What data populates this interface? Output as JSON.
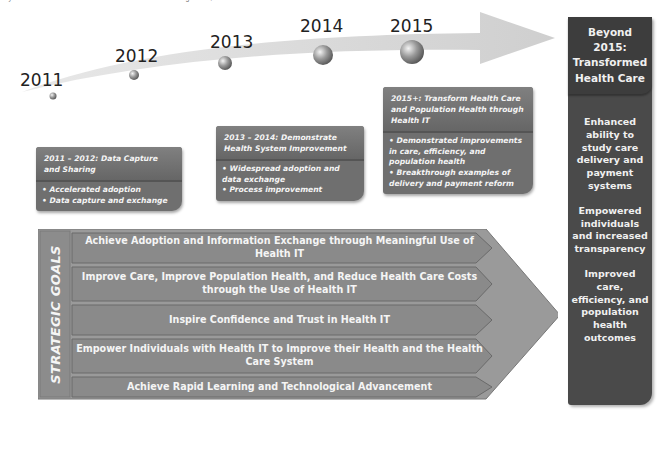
{
  "caption": "Key Milestones and Goals from the Federal Health IT Strategic Plan, 2011-2015",
  "timeline": {
    "years": [
      {
        "label": "2011"
      },
      {
        "label": "2012"
      },
      {
        "label": "2013"
      },
      {
        "label": "2014"
      },
      {
        "label": "2015"
      }
    ]
  },
  "phases": [
    {
      "title": "2011 – 2012: Data Capture and Sharing",
      "bullets": [
        "Accelerated adoption",
        "Data capture and exchange"
      ]
    },
    {
      "title": "2013 – 2014: Demonstrate Health System Improvement",
      "bullets": [
        "Widespread adoption and data exchange",
        "Process improvement"
      ]
    },
    {
      "title": "2015+: Transform Health Care and Population Health through Health IT",
      "bullets": [
        "Demonstrated improvements in care, efficiency, and population health",
        "Breakthrough examples of delivery and payment reform"
      ]
    }
  ],
  "beyond": {
    "title": "Beyond 2015: Transformed Health Care",
    "outcomes": [
      "Enhanced ability to study care delivery and payment systems",
      "Empowered individuals and increased transparency",
      "Improved care, efficiency, and population health outcomes"
    ]
  },
  "strategic_goals": {
    "label": "STRATEGIC GOALS",
    "goals": [
      "Achieve Adoption and Information Exchange through Meaningful Use of Health IT",
      "Improve Care, Improve Population Health, and Reduce Health Care Costs through the Use of Health IT",
      "Inspire Confidence and Trust in Health IT",
      "Empower Individuals with Health IT to Improve their Health and the Health Care System",
      "Achieve Rapid Learning and Technological Advancement"
    ]
  },
  "colors": {
    "phase_box": "#6f6f6f",
    "beyond_box": "#4a4a4a",
    "goal_bar": "#8a8a8a",
    "arrow": "#d6d6d6"
  }
}
